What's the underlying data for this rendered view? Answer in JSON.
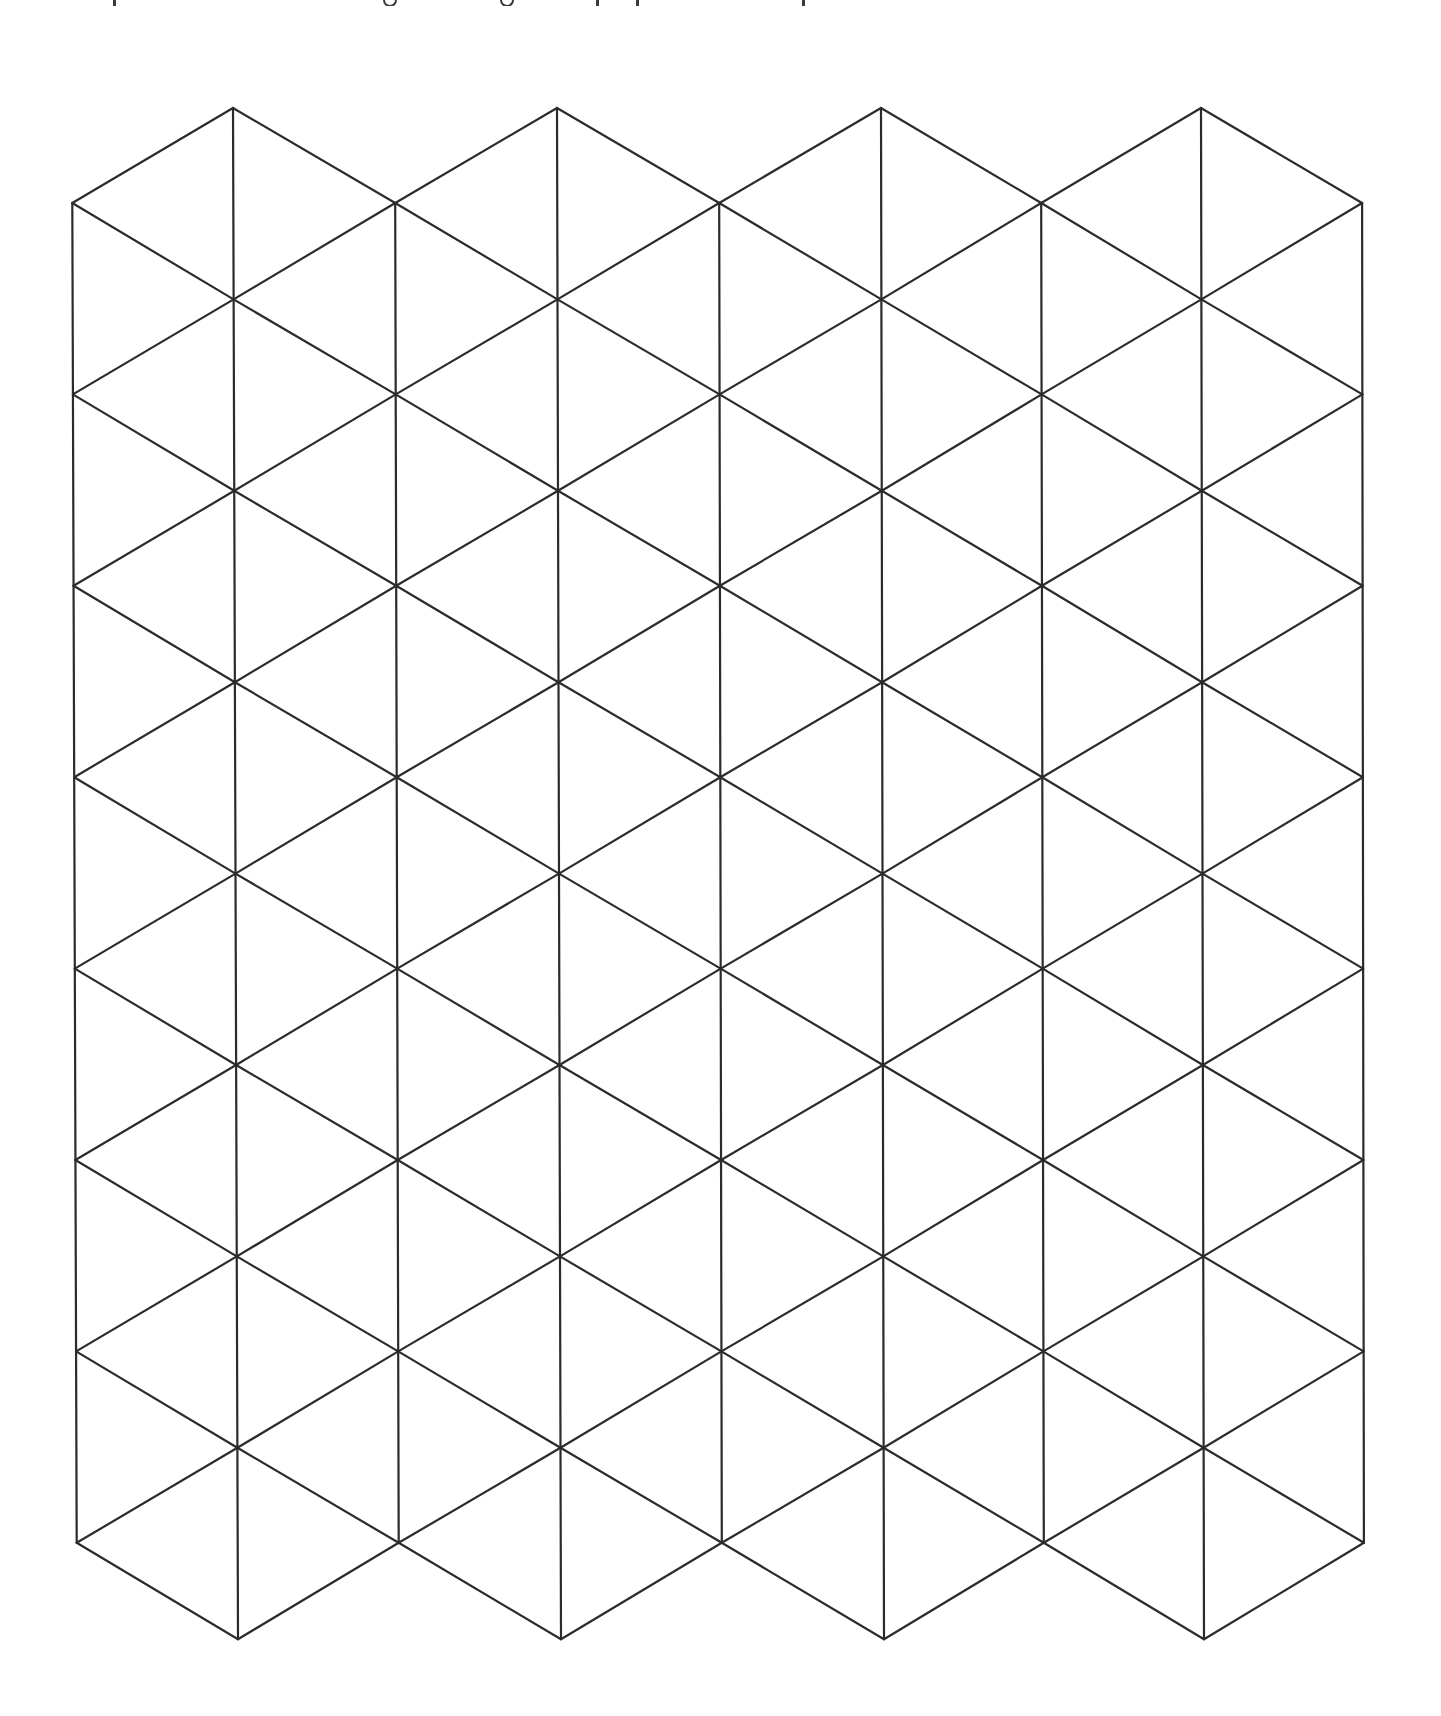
{
  "page": {
    "background": "#ffffff",
    "top_text_fragment": {
      "note": "cut-off descenders of a line of text above the visible area",
      "marks": [
        {
          "type": "stem",
          "x": 113
        },
        {
          "type": "round",
          "x": 383
        },
        {
          "type": "round",
          "x": 500
        },
        {
          "type": "stem",
          "x": 596
        },
        {
          "type": "stem",
          "x": 636
        },
        {
          "type": "stem",
          "x": 802
        }
      ]
    }
  },
  "grid": {
    "type": "isometric-triangle-grid",
    "stroke_color": "#2b2b2b",
    "stroke_width": 2.2,
    "columns": 4,
    "half_column_x_top": [
      72,
      233,
      395,
      557,
      719,
      881,
      1041,
      1201,
      1362
    ],
    "half_column_x_drift_bottom": [
      5,
      5,
      4,
      4,
      3,
      3,
      3,
      3,
      2
    ],
    "center_node_y_start": 108,
    "edge_node_y_start": 203,
    "row_step": 191.4,
    "center_node_rows": 9,
    "edge_node_rows": 8,
    "y_top": 108,
    "y_bottom": 1639
  }
}
